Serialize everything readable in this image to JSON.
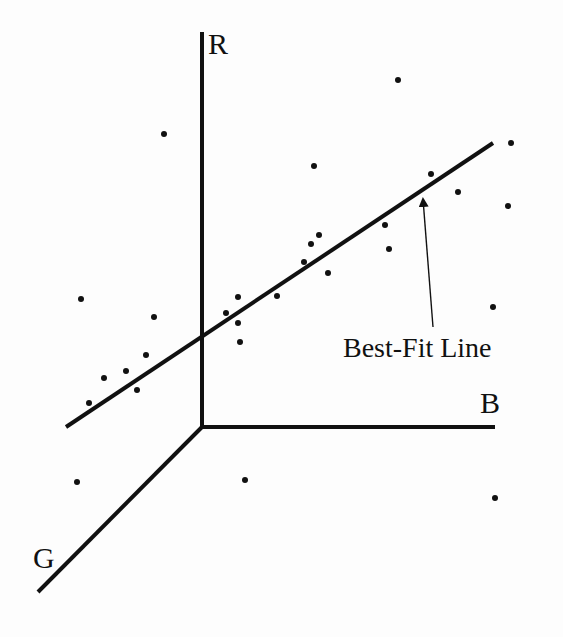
{
  "diagram": {
    "title": "",
    "colors": {
      "ink": "#111111",
      "background": "#fdfdfd"
    },
    "origin": [
      202,
      427
    ],
    "axes": [
      {
        "name": "R",
        "label": "R",
        "from": [
          202,
          427
        ],
        "to": [
          202,
          32
        ],
        "label_pos": [
          208,
          54
        ]
      },
      {
        "name": "B",
        "label": "B",
        "from": [
          202,
          427
        ],
        "to": [
          495,
          427
        ],
        "label_pos": [
          480,
          413
        ]
      },
      {
        "name": "G",
        "label": "G",
        "from": [
          202,
          427
        ],
        "to": [
          38,
          592
        ],
        "label_pos": [
          33,
          568
        ]
      }
    ],
    "best_fit_line": {
      "from": [
        66,
        427
      ],
      "to": [
        493,
        143
      ]
    },
    "annotation": {
      "text": "Best-Fit Line",
      "text_pos": [
        343,
        357
      ],
      "arrow_from": [
        433,
        327
      ],
      "arrow_to": [
        423,
        199
      ]
    },
    "points": [
      [
        398,
        80
      ],
      [
        164,
        134
      ],
      [
        511,
        143
      ],
      [
        314,
        166
      ],
      [
        431,
        174
      ],
      [
        458,
        192
      ],
      [
        508,
        206
      ],
      [
        385,
        225
      ],
      [
        319,
        235
      ],
      [
        311,
        244
      ],
      [
        389,
        249
      ],
      [
        304,
        262
      ],
      [
        328,
        273
      ],
      [
        81,
        299
      ],
      [
        238,
        297
      ],
      [
        277,
        296
      ],
      [
        493,
        307
      ],
      [
        154,
        317
      ],
      [
        226,
        313
      ],
      [
        238,
        323
      ],
      [
        240,
        342
      ],
      [
        146,
        355
      ],
      [
        126,
        371
      ],
      [
        104,
        378
      ],
      [
        137,
        390
      ],
      [
        89,
        403
      ],
      [
        77,
        482
      ],
      [
        245,
        480
      ],
      [
        495,
        498
      ]
    ]
  }
}
